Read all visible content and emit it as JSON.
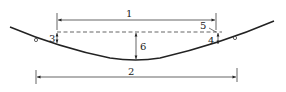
{
  "diagram": {
    "type": "sag-dimension-drawing",
    "colors": {
      "line": "#222222",
      "background": "#ffffff"
    },
    "labels": {
      "dim1": "1",
      "dim2": "2",
      "dim3": "3",
      "dim4": "4",
      "dim5": "5",
      "dim6": "6"
    }
  }
}
